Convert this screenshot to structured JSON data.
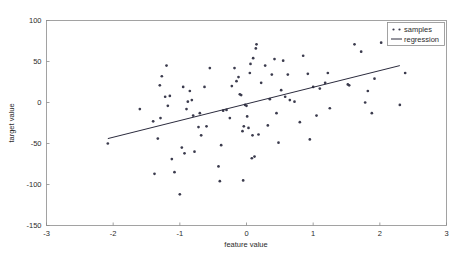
{
  "chart_data": {
    "type": "scatter",
    "title": "",
    "xlabel": "feature value",
    "ylabel": "target value",
    "xlim": [
      -3,
      3
    ],
    "ylim": [
      -150,
      100
    ],
    "xticks": [
      -3,
      -2,
      -1,
      0,
      1,
      2,
      3
    ],
    "yticks": [
      -150,
      -100,
      -50,
      0,
      50,
      100
    ],
    "xtick_labels": [
      "-3",
      "-2",
      "-1",
      "0",
      "1",
      "2",
      "3"
    ],
    "ytick_labels": [
      "-150",
      "-100",
      "-50",
      "0",
      "50",
      "100"
    ],
    "grid": false,
    "legend_position": "upper right",
    "legend": [
      "samples",
      "regression"
    ],
    "marker_color": "#3b3b4d",
    "line_color": "#2b2b3d",
    "series": [
      {
        "name": "samples",
        "type": "scatter",
        "points": [
          [
            -2.08,
            -50
          ],
          [
            -1.6,
            -8
          ],
          [
            -1.4,
            -23
          ],
          [
            -1.38,
            -87
          ],
          [
            -1.33,
            -44
          ],
          [
            -1.3,
            21
          ],
          [
            -1.29,
            -19
          ],
          [
            -1.27,
            32
          ],
          [
            -1.22,
            7
          ],
          [
            -1.2,
            45
          ],
          [
            -1.18,
            -4
          ],
          [
            -1.15,
            8
          ],
          [
            -1.12,
            -69
          ],
          [
            -1.08,
            -85
          ],
          [
            -1.0,
            -112
          ],
          [
            -0.97,
            -55
          ],
          [
            -0.95,
            19
          ],
          [
            -0.93,
            -62
          ],
          [
            -0.9,
            -8
          ],
          [
            -0.88,
            1
          ],
          [
            -0.85,
            14
          ],
          [
            -0.82,
            3
          ],
          [
            -0.8,
            -16
          ],
          [
            -0.78,
            -60
          ],
          [
            -0.72,
            -30
          ],
          [
            -0.7,
            -13
          ],
          [
            -0.68,
            -40
          ],
          [
            -0.63,
            19
          ],
          [
            -0.6,
            -29
          ],
          [
            -0.55,
            42
          ],
          [
            -0.42,
            -78
          ],
          [
            -0.4,
            -96
          ],
          [
            -0.38,
            -52
          ],
          [
            -0.35,
            -10
          ],
          [
            -0.3,
            -9
          ],
          [
            -0.25,
            -19
          ],
          [
            -0.22,
            20
          ],
          [
            -0.18,
            42
          ],
          [
            -0.15,
            26
          ],
          [
            -0.12,
            31
          ],
          [
            -0.1,
            10
          ],
          [
            -0.08,
            9
          ],
          [
            -0.06,
            -35
          ],
          [
            -0.05,
            -95
          ],
          [
            -0.04,
            -29
          ],
          [
            -0.02,
            -3
          ],
          [
            0.0,
            -4
          ],
          [
            0.01,
            -17
          ],
          [
            0.03,
            -31
          ],
          [
            0.05,
            36
          ],
          [
            0.06,
            47
          ],
          [
            0.08,
            -68
          ],
          [
            0.09,
            -40
          ],
          [
            0.1,
            54
          ],
          [
            0.12,
            -66
          ],
          [
            0.14,
            66
          ],
          [
            0.15,
            71
          ],
          [
            0.18,
            -39
          ],
          [
            0.22,
            24
          ],
          [
            0.28,
            45
          ],
          [
            0.32,
            -28
          ],
          [
            0.35,
            4
          ],
          [
            0.38,
            34
          ],
          [
            0.42,
            53
          ],
          [
            0.45,
            -13
          ],
          [
            0.48,
            -49
          ],
          [
            0.52,
            15
          ],
          [
            0.55,
            51
          ],
          [
            0.58,
            7
          ],
          [
            0.62,
            34
          ],
          [
            0.65,
            3
          ],
          [
            0.72,
            1
          ],
          [
            0.8,
            -24
          ],
          [
            0.85,
            57
          ],
          [
            0.92,
            35
          ],
          [
            0.95,
            -45
          ],
          [
            1.0,
            19
          ],
          [
            1.05,
            -16
          ],
          [
            1.1,
            17
          ],
          [
            1.18,
            24
          ],
          [
            1.22,
            36
          ],
          [
            1.25,
            -7
          ],
          [
            1.52,
            22
          ],
          [
            1.54,
            21
          ],
          [
            1.62,
            71
          ],
          [
            1.72,
            62
          ],
          [
            1.78,
            0
          ],
          [
            1.82,
            14
          ],
          [
            1.88,
            -13
          ],
          [
            1.92,
            29
          ],
          [
            2.02,
            73
          ],
          [
            2.3,
            -3
          ],
          [
            2.38,
            36
          ]
        ]
      },
      {
        "name": "regression",
        "type": "line",
        "x_endpoints": [
          -2.08,
          2.3
        ],
        "y_endpoints": [
          -44,
          45
        ],
        "slope": 20.3,
        "intercept": -1.8
      }
    ]
  },
  "legend": {
    "samples_label": "samples",
    "regression_label": "regression"
  },
  "axes": {
    "x_title": "feature value",
    "y_title": "target value"
  }
}
